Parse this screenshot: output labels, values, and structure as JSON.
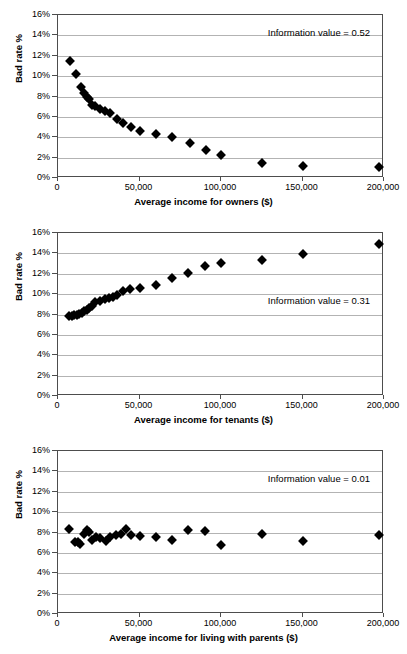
{
  "figure": {
    "background": "#ffffff",
    "marker_color": "#000000",
    "grid_color": "#b3b3b3",
    "axis_color": "#4d4d4d"
  },
  "common": {
    "ylabel": "Bad rate %",
    "yticks": [
      "0%",
      "2%",
      "4%",
      "6%",
      "8%",
      "10%",
      "12%",
      "14%",
      "16%"
    ],
    "xticks": [
      "0",
      "50,000",
      "100,000",
      "150,000",
      "200,000"
    ]
  },
  "chart_data": [
    {
      "id": "owners",
      "type": "scatter",
      "title": "",
      "xlabel": "Average income for owners ($)",
      "ylabel": "Bad rate %",
      "xlim": [
        0,
        200000
      ],
      "ylim": [
        0,
        16
      ],
      "ytick_values": [
        0,
        2,
        4,
        6,
        8,
        10,
        12,
        14,
        16
      ],
      "ytick_labels": [
        "0%",
        "2%",
        "4%",
        "6%",
        "8%",
        "10%",
        "12%",
        "14%",
        "16%"
      ],
      "xtick_values": [
        0,
        50000,
        100000,
        150000,
        200000
      ],
      "xtick_labels": [
        "0",
        "50,000",
        "100,000",
        "150,000",
        "200,000"
      ],
      "grid": true,
      "annotation": "Information value = 0.52",
      "x": [
        7500,
        11000,
        14000,
        16000,
        17500,
        19000,
        21000,
        23000,
        26000,
        29000,
        32000,
        36000,
        40000,
        45000,
        50000,
        60000,
        70000,
        81000,
        91000,
        100000,
        125000,
        150000,
        197000
      ],
      "y": [
        11.5,
        10.2,
        8.9,
        8.3,
        8.0,
        7.8,
        7.2,
        7.1,
        6.8,
        6.6,
        6.4,
        5.8,
        5.4,
        5.0,
        4.65,
        4.3,
        4.0,
        3.4,
        2.75,
        2.25,
        1.5,
        1.15,
        1.1
      ]
    },
    {
      "id": "tenants",
      "type": "scatter",
      "title": "",
      "xlabel": "Average income for tenants ($)",
      "ylabel": "Bad rate %",
      "xlim": [
        0,
        200000
      ],
      "ylim": [
        0,
        16
      ],
      "ytick_values": [
        0,
        2,
        4,
        6,
        8,
        10,
        12,
        14,
        16
      ],
      "ytick_labels": [
        "0%",
        "2%",
        "4%",
        "6%",
        "8%",
        "10%",
        "12%",
        "14%",
        "16%"
      ],
      "xtick_values": [
        0,
        50000,
        100000,
        150000,
        200000
      ],
      "xtick_labels": [
        "0",
        "50,000",
        "100,000",
        "150,000",
        "200,000"
      ],
      "grid": true,
      "annotation": "Information value = 0.31",
      "x": [
        6500,
        8500,
        10000,
        11500,
        13000,
        14500,
        16000,
        17500,
        19000,
        21000,
        23000,
        26000,
        29000,
        31000,
        33500,
        36500,
        40000,
        44000,
        50000,
        60000,
        70000,
        80000,
        90000,
        100000,
        125000,
        150000,
        197000
      ],
      "y": [
        7.9,
        7.9,
        7.95,
        8.0,
        8.05,
        8.15,
        8.3,
        8.45,
        8.6,
        8.8,
        9.2,
        9.35,
        9.55,
        9.65,
        9.75,
        9.9,
        10.3,
        10.5,
        10.65,
        10.85,
        11.55,
        12.05,
        12.75,
        13.05,
        13.35,
        13.95,
        14.95
      ]
    },
    {
      "id": "parents",
      "type": "scatter",
      "title": "",
      "xlabel": "Average income for living with parents ($)",
      "ylabel": "Bad rate %",
      "xlim": [
        0,
        200000
      ],
      "ylim": [
        0,
        16
      ],
      "ytick_values": [
        0,
        2,
        4,
        6,
        8,
        10,
        12,
        14,
        16
      ],
      "ytick_labels": [
        "0%",
        "2%",
        "4%",
        "6%",
        "8%",
        "10%",
        "12%",
        "14%",
        "16%"
      ],
      "xtick_values": [
        0,
        50000,
        100000,
        150000,
        200000
      ],
      "xtick_labels": [
        "0",
        "50,000",
        "100,000",
        "150,000",
        "200,000"
      ],
      "grid": true,
      "annotation": "Information value = 0.01",
      "x": [
        7000,
        10500,
        12000,
        13500,
        16000,
        17500,
        19000,
        21000,
        23500,
        26000,
        29500,
        32000,
        35500,
        38500,
        42000,
        45000,
        50000,
        60000,
        70000,
        80000,
        90000,
        100000,
        125000,
        150000,
        197000
      ],
      "y": [
        8.35,
        7.1,
        7.05,
        6.9,
        7.85,
        8.2,
        8.05,
        7.3,
        7.55,
        7.45,
        7.2,
        7.55,
        7.75,
        7.9,
        8.3,
        7.8,
        7.7,
        7.6,
        7.3,
        8.2,
        8.15,
        6.8,
        7.85,
        7.15,
        7.75
      ]
    }
  ]
}
